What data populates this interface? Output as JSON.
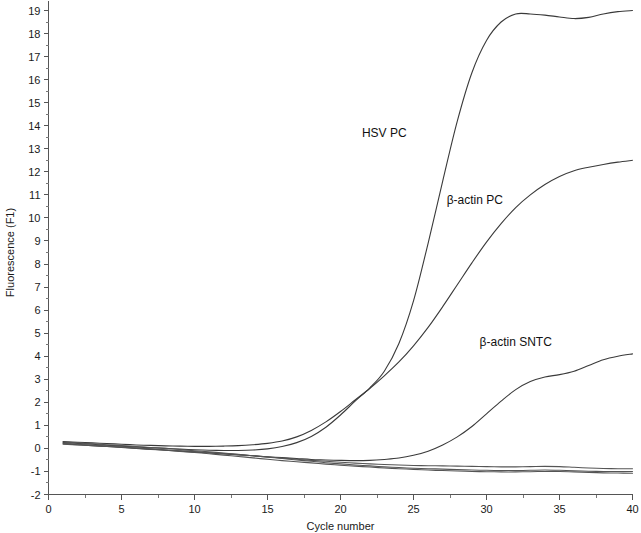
{
  "chart_data": {
    "type": "line",
    "title": "",
    "xlabel": "Cycle number",
    "ylabel": "Fluorescence (F1)",
    "xlim": [
      0,
      40
    ],
    "ylim": [
      -2,
      19.4
    ],
    "grid": false,
    "legend_position": "inline-annotations",
    "x_ticks": [
      0,
      5,
      10,
      15,
      20,
      25,
      30,
      35,
      40
    ],
    "x_tick_labels": [
      "0",
      "5",
      "10",
      "15",
      "20",
      "25",
      "30",
      "35",
      "40"
    ],
    "x_minor_ticks": [
      2.5,
      7.5,
      12.5,
      17.5,
      22.5,
      27.5,
      32.5,
      37.5
    ],
    "y_ticks": [
      -2,
      -1,
      0,
      1,
      2,
      3,
      4,
      5,
      6,
      7,
      8,
      9,
      10,
      11,
      12,
      13,
      14,
      15,
      16,
      17,
      18,
      19
    ],
    "y_tick_labels": [
      "-2",
      "-1",
      "0",
      "1",
      "2",
      "3",
      "4",
      "5",
      "6",
      "7",
      "8",
      "9",
      "10",
      "11",
      "12",
      "13",
      "14",
      "15",
      "16",
      "17",
      "18",
      "19"
    ],
    "y_minor_ticks": [
      -1.5,
      -0.5,
      0.5,
      1.5,
      2.5,
      3.5,
      4.5,
      5.5,
      6.5,
      7.5,
      8.5,
      9.5,
      10.5,
      11.5,
      12.5,
      13.5,
      14.5,
      15.5,
      16.5,
      17.5,
      18.5
    ],
    "line_color": "#3a3a3a",
    "background_color": "#ffffff",
    "x": [
      1,
      2,
      3,
      4,
      5,
      6,
      7,
      8,
      9,
      10,
      11,
      12,
      13,
      14,
      15,
      16,
      17,
      18,
      19,
      20,
      21,
      22,
      23,
      24,
      25,
      26,
      27,
      28,
      29,
      30,
      31,
      32,
      33,
      34,
      35,
      36,
      37,
      38,
      39,
      40
    ],
    "series": [
      {
        "name": "HSV PC",
        "label": "HSV PC",
        "label_x": 23.0,
        "label_y": 13.5,
        "values": [
          0.25,
          0.22,
          0.18,
          0.14,
          0.1,
          0.06,
          0.03,
          0.0,
          -0.03,
          -0.06,
          -0.08,
          -0.09,
          -0.09,
          -0.07,
          -0.02,
          0.08,
          0.25,
          0.52,
          0.92,
          1.45,
          2.05,
          2.62,
          3.35,
          4.55,
          6.4,
          8.9,
          11.6,
          14.2,
          16.3,
          17.7,
          18.5,
          18.85,
          18.85,
          18.8,
          18.72,
          18.65,
          18.7,
          18.85,
          18.95,
          19.0
        ]
      },
      {
        "name": "beta-actin PC",
        "label": "β-actin PC",
        "label_x": 29.2,
        "label_y": 10.6,
        "values": [
          0.3,
          0.27,
          0.24,
          0.21,
          0.18,
          0.15,
          0.13,
          0.11,
          0.1,
          0.09,
          0.09,
          0.1,
          0.12,
          0.16,
          0.22,
          0.32,
          0.5,
          0.78,
          1.15,
          1.6,
          2.1,
          2.6,
          3.15,
          3.75,
          4.45,
          5.25,
          6.15,
          7.1,
          8.05,
          8.95,
          9.75,
          10.45,
          11.0,
          11.45,
          11.8,
          12.05,
          12.2,
          12.32,
          12.42,
          12.5
        ]
      },
      {
        "name": "beta-actin SNTC",
        "label": "β-actin SNTC",
        "label_x": 32.0,
        "label_y": 4.45,
        "values": [
          0.2,
          0.16,
          0.12,
          0.08,
          0.04,
          0.0,
          -0.04,
          -0.08,
          -0.12,
          -0.16,
          -0.2,
          -0.24,
          -0.28,
          -0.32,
          -0.36,
          -0.4,
          -0.44,
          -0.48,
          -0.5,
          -0.52,
          -0.53,
          -0.52,
          -0.48,
          -0.42,
          -0.3,
          -0.12,
          0.15,
          0.5,
          0.95,
          1.5,
          2.05,
          2.55,
          2.9,
          3.1,
          3.2,
          3.35,
          3.6,
          3.85,
          4.0,
          4.1
        ]
      },
      {
        "name": "negative-baseline-1",
        "label": "",
        "label_x": null,
        "label_y": null,
        "values": [
          0.22,
          0.18,
          0.14,
          0.1,
          0.06,
          0.02,
          -0.02,
          -0.06,
          -0.1,
          -0.14,
          -0.18,
          -0.22,
          -0.27,
          -0.32,
          -0.37,
          -0.42,
          -0.47,
          -0.52,
          -0.56,
          -0.6,
          -0.64,
          -0.67,
          -0.7,
          -0.72,
          -0.74,
          -0.75,
          -0.76,
          -0.77,
          -0.78,
          -0.79,
          -0.8,
          -0.8,
          -0.79,
          -0.78,
          -0.79,
          -0.82,
          -0.85,
          -0.87,
          -0.88,
          -0.88
        ]
      },
      {
        "name": "negative-baseline-2",
        "label": "",
        "label_x": null,
        "label_y": null,
        "values": [
          0.28,
          0.24,
          0.2,
          0.16,
          0.12,
          0.08,
          0.04,
          0.0,
          -0.05,
          -0.1,
          -0.15,
          -0.2,
          -0.26,
          -0.32,
          -0.38,
          -0.44,
          -0.5,
          -0.56,
          -0.62,
          -0.67,
          -0.72,
          -0.76,
          -0.8,
          -0.83,
          -0.86,
          -0.88,
          -0.9,
          -0.92,
          -0.94,
          -0.95,
          -0.96,
          -0.96,
          -0.95,
          -0.94,
          -0.95,
          -0.97,
          -0.99,
          -1.0,
          -1.0,
          -1.0
        ]
      },
      {
        "name": "negative-baseline-3",
        "label": "",
        "label_x": null,
        "label_y": null,
        "values": [
          0.18,
          0.15,
          0.12,
          0.09,
          0.05,
          0.01,
          -0.03,
          -0.08,
          -0.13,
          -0.18,
          -0.23,
          -0.29,
          -0.35,
          -0.41,
          -0.47,
          -0.53,
          -0.58,
          -0.63,
          -0.68,
          -0.73,
          -0.77,
          -0.81,
          -0.85,
          -0.88,
          -0.91,
          -0.94,
          -0.96,
          -0.98,
          -1.0,
          -1.01,
          -1.02,
          -1.02,
          -1.01,
          -1.0,
          -1.0,
          -1.02,
          -1.04,
          -1.06,
          -1.07,
          -1.08
        ]
      }
    ],
    "annotations": [
      {
        "text": "HSV PC",
        "x": 23.0,
        "y": 13.5
      },
      {
        "text": "β-actin PC",
        "x": 29.2,
        "y": 10.6
      },
      {
        "text": "β-actin SNTC",
        "x": 32.0,
        "y": 4.45
      }
    ]
  }
}
